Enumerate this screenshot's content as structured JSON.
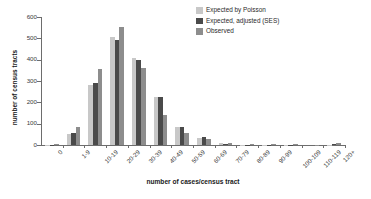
{
  "chart_data": {
    "type": "bar",
    "title": "",
    "subtitle": "",
    "xlabel": "number of cases/census tract",
    "ylabel": "number of census tracts",
    "ylim": [
      0,
      600
    ],
    "yticks": [
      0,
      100,
      200,
      300,
      400,
      500,
      600
    ],
    "grid": false,
    "legend_position": "top-right",
    "categories": [
      "0",
      "1-9",
      "10-19",
      "20-29",
      "30-39",
      "40-49",
      "50-59",
      "60-69",
      "70-79",
      "80-89",
      "90-99",
      "100-109",
      "110-119",
      "120+"
    ],
    "series": [
      {
        "name": "Expected by Poisson",
        "color": "#c8c8c8",
        "values": [
          1,
          50,
          283,
          505,
          408,
          225,
          86,
          32,
          8,
          2,
          1,
          1,
          0,
          2
        ]
      },
      {
        "name": "Expected, adjusted (SES)",
        "color": "#4a4a4a",
        "values": [
          2,
          56,
          290,
          490,
          400,
          225,
          85,
          36,
          5,
          2,
          1,
          1,
          0,
          3
        ]
      },
      {
        "name": "Observed",
        "color": "#8d8d8d",
        "values": [
          7,
          83,
          355,
          553,
          360,
          140,
          58,
          27,
          11,
          3,
          3,
          3,
          1,
          8
        ]
      }
    ]
  },
  "legend": {
    "items": [
      {
        "label": "Expected by Poisson",
        "color": "#c8c8c8"
      },
      {
        "label": "Expected, adjusted (SES)",
        "color": "#4a4a4a"
      },
      {
        "label": "Observed",
        "color": "#8d8d8d"
      }
    ]
  },
  "axes": {
    "y_title": "number of census tracts",
    "x_title": "number of cases/census tract"
  }
}
